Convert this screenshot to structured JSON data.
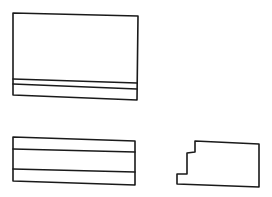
{
  "canvas": {
    "width": 272,
    "height": 197,
    "background": "#ffffff",
    "stroke_color": "#1a1a1a"
  },
  "shapes": [
    {
      "name": "wireframe-panel-large",
      "outline": [
        [
          13,
          13
        ],
        [
          138,
          16
        ],
        [
          137,
          100
        ],
        [
          13,
          95
        ]
      ],
      "dividers": [
        [
          [
            13,
            79
          ],
          [
            137,
            83
          ]
        ],
        [
          [
            13,
            84
          ],
          [
            137,
            89
          ]
        ]
      ]
    },
    {
      "name": "wireframe-panel-striped",
      "outline": [
        [
          13,
          137
        ],
        [
          135,
          141
        ],
        [
          135,
          185
        ],
        [
          13,
          181
        ]
      ],
      "dividers": [
        [
          [
            13,
            149
          ],
          [
            135,
            152
          ]
        ],
        [
          [
            13,
            169
          ],
          [
            135,
            172
          ]
        ]
      ]
    },
    {
      "name": "wireframe-notched-block",
      "outline": [
        [
          195,
          141
        ],
        [
          259,
          144
        ],
        [
          259,
          187
        ],
        [
          177,
          184
        ],
        [
          177,
          174
        ],
        [
          187,
          174
        ],
        [
          187,
          153
        ],
        [
          195,
          152
        ]
      ],
      "dividers": []
    }
  ]
}
